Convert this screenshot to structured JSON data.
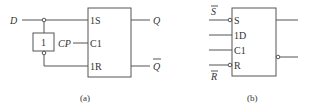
{
  "diagram_a": {
    "caption": "(a)",
    "input_d": "D",
    "input_cp": "CP",
    "inverter_label": "1",
    "pin_1s": "1S",
    "pin_c1": "C1",
    "pin_1r": "1R",
    "output_q": "Q",
    "output_qbar": "Q"
  },
  "diagram_b": {
    "caption": "(b)",
    "input_sbar": "S",
    "input_rbar": "R",
    "pin_s": "S",
    "pin_1d": "1D",
    "pin_c1": "C1",
    "pin_r": "R"
  },
  "colors": {
    "line": "#555555",
    "text": "#333333"
  }
}
